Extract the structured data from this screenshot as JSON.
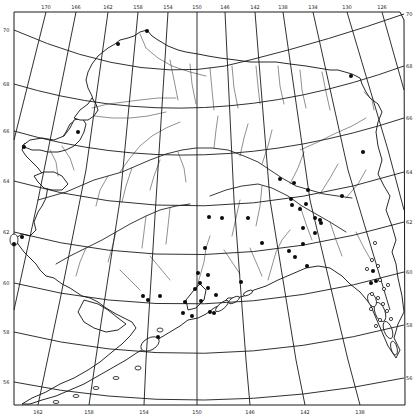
{
  "map": {
    "title": "Alaska",
    "style": "black-and-white outline map with graticule, drainage network and site markers",
    "colors": {
      "background": "#ffffff",
      "ink": "#111111"
    },
    "top_longitude_labels": [
      {
        "label": "170",
        "x": 46
      },
      {
        "label": "166",
        "x": 76
      },
      {
        "label": "162",
        "x": 108
      },
      {
        "label": "158",
        "x": 138
      },
      {
        "label": "154",
        "x": 168
      },
      {
        "label": "150",
        "x": 197
      },
      {
        "label": "146",
        "x": 225
      },
      {
        "label": "142",
        "x": 255
      },
      {
        "label": "138",
        "x": 283
      },
      {
        "label": "134",
        "x": 313
      },
      {
        "label": "130",
        "x": 347
      },
      {
        "label": "126",
        "x": 382
      }
    ],
    "bottom_longitude_labels": [
      {
        "label": "162",
        "x": 38
      },
      {
        "label": "158",
        "x": 89
      },
      {
        "label": "154",
        "x": 144
      },
      {
        "label": "150",
        "x": 197
      },
      {
        "label": "146",
        "x": 250
      },
      {
        "label": "142",
        "x": 305
      },
      {
        "label": "138",
        "x": 360
      }
    ],
    "left_latitude_labels": [
      {
        "label": "70",
        "y": 30
      },
      {
        "label": "68",
        "y": 84
      },
      {
        "label": "66",
        "y": 131
      },
      {
        "label": "64",
        "y": 181
      },
      {
        "label": "62",
        "y": 232
      },
      {
        "label": "60",
        "y": 283
      },
      {
        "label": "58",
        "y": 332
      },
      {
        "label": "56",
        "y": 382
      }
    ],
    "right_latitude_labels": [
      {
        "label": "70",
        "y": 14
      },
      {
        "label": "68",
        "y": 66
      },
      {
        "label": "66",
        "y": 118
      },
      {
        "label": "64",
        "y": 172
      },
      {
        "label": "62",
        "y": 222
      },
      {
        "label": "60",
        "y": 272
      },
      {
        "label": "58",
        "y": 325
      },
      {
        "label": "56",
        "y": 378
      }
    ],
    "sites_filled": [
      [
        118,
        44
      ],
      [
        147,
        31
      ],
      [
        78,
        132
      ],
      [
        24,
        147
      ],
      [
        351,
        76
      ],
      [
        280,
        179
      ],
      [
        294,
        183
      ],
      [
        308,
        190
      ],
      [
        291,
        199
      ],
      [
        315,
        218
      ],
      [
        321,
        223
      ],
      [
        320,
        220
      ],
      [
        262,
        243
      ],
      [
        289,
        251
      ],
      [
        295,
        257
      ],
      [
        307,
        266
      ],
      [
        209,
        217
      ],
      [
        222,
        218
      ],
      [
        248,
        218
      ],
      [
        292,
        205
      ],
      [
        300,
        209
      ],
      [
        306,
        204
      ],
      [
        303,
        228
      ],
      [
        315,
        233
      ],
      [
        303,
        244
      ],
      [
        342,
        196
      ],
      [
        363,
        152
      ],
      [
        205,
        248
      ],
      [
        208,
        275
      ],
      [
        198,
        273
      ],
      [
        200,
        283
      ],
      [
        208,
        288
      ],
      [
        216,
        295
      ],
      [
        192,
        316
      ],
      [
        185,
        302
      ],
      [
        160,
        296
      ],
      [
        143,
        296
      ],
      [
        148,
        300
      ],
      [
        214,
        313
      ],
      [
        210,
        312
      ],
      [
        241,
        282
      ],
      [
        201,
        301
      ],
      [
        158,
        337
      ],
      [
        183,
        313
      ],
      [
        195,
        289
      ],
      [
        373,
        271
      ],
      [
        371,
        283
      ],
      [
        376,
        281
      ],
      [
        22,
        237
      ],
      [
        14,
        244
      ]
    ],
    "sites_open": [
      [
        375,
        243
      ],
      [
        372,
        260
      ],
      [
        378,
        266
      ],
      [
        367,
        269
      ],
      [
        380,
        280
      ],
      [
        388,
        285
      ],
      [
        384,
        289
      ],
      [
        372,
        294
      ],
      [
        378,
        298
      ],
      [
        383,
        304
      ],
      [
        371,
        309
      ],
      [
        387,
        311
      ],
      [
        391,
        319
      ],
      [
        380,
        320
      ],
      [
        376,
        326
      ]
    ]
  }
}
